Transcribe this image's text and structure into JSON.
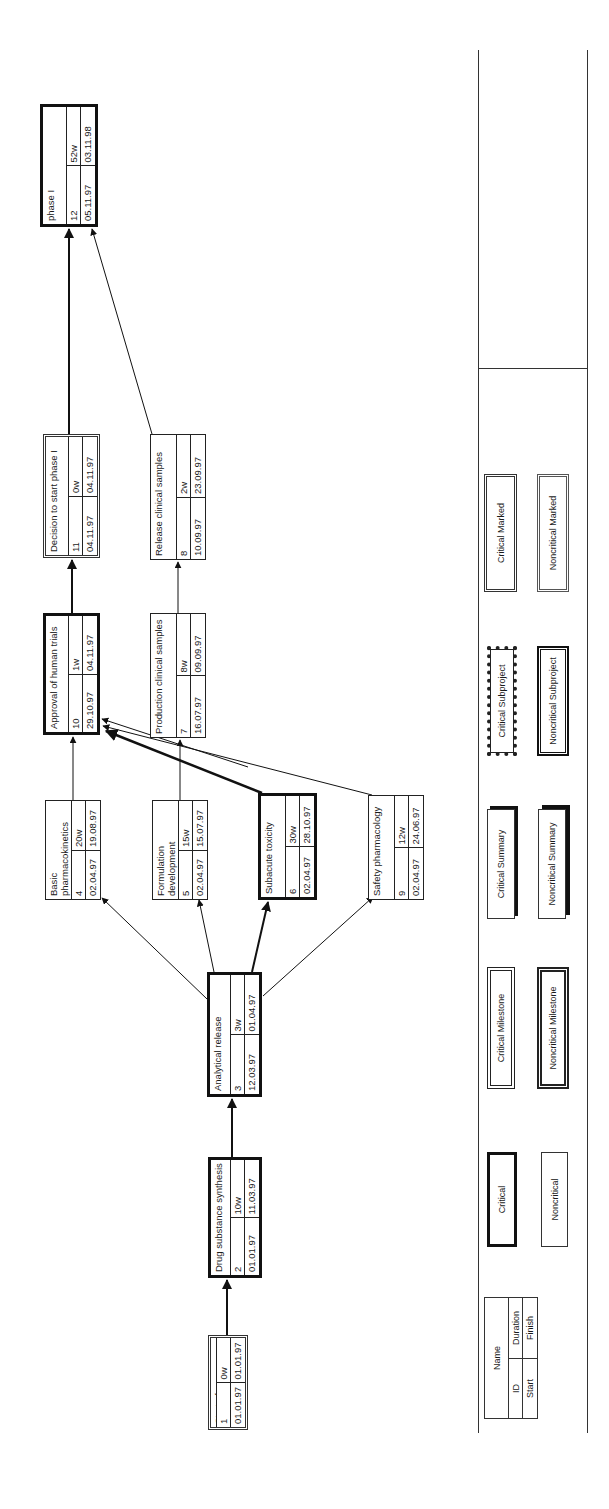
{
  "diagram": {
    "type": "network-diagram",
    "orientation": "rotated-90-ccw",
    "nodes": [
      {
        "key": "n1",
        "name": "Start of development",
        "id": "1",
        "duration": "0w",
        "start": "01.01.97",
        "finish": "01.01.97",
        "style": "milestone"
      },
      {
        "key": "n2",
        "name": "Drug substance synthesis",
        "id": "2",
        "duration": "10w",
        "start": "01.01.97",
        "finish": "11.03.97",
        "style": "critical"
      },
      {
        "key": "n3",
        "name": "Analytical release",
        "id": "3",
        "duration": "3w",
        "start": "12.03.97",
        "finish": "01.04.97",
        "style": "critical"
      },
      {
        "key": "n4",
        "name": "Basic pharmacokinetics",
        "id": "4",
        "duration": "20w",
        "start": "02.04.97",
        "finish": "19.08.97",
        "style": "noncritical"
      },
      {
        "key": "n5",
        "name": "Formulation development",
        "id": "5",
        "duration": "15w",
        "start": "02.04.97",
        "finish": "15.07.97",
        "style": "noncritical"
      },
      {
        "key": "n6",
        "name": "Subacute toxicity",
        "id": "6",
        "duration": "30w",
        "start": "02.04.97",
        "finish": "28.10.97",
        "style": "critical"
      },
      {
        "key": "n9",
        "name": "Safety pharmacology",
        "id": "9",
        "duration": "12w",
        "start": "02.04.97",
        "finish": "24.06.97",
        "style": "noncritical"
      },
      {
        "key": "n10",
        "name": "Approval of human trials",
        "id": "10",
        "duration": "1w",
        "start": "29.10.97",
        "finish": "04.11.97",
        "style": "critical"
      },
      {
        "key": "n7",
        "name": "Production clinical samples",
        "id": "7",
        "duration": "8w",
        "start": "16.07.97",
        "finish": "09.09.97",
        "style": "noncritical"
      },
      {
        "key": "n11",
        "name": "Decision to start phase I",
        "id": "11",
        "duration": "0w",
        "start": "04.11.97",
        "finish": "04.11.97",
        "style": "milestone"
      },
      {
        "key": "n8",
        "name": "Release clinical samples",
        "id": "8",
        "duration": "2w",
        "start": "10.09.97",
        "finish": "23.09.97",
        "style": "noncritical"
      },
      {
        "key": "n12",
        "name": "phase I",
        "id": "12",
        "duration": "52w",
        "start": "05.11.97",
        "finish": "03.11.98",
        "style": "critical"
      }
    ],
    "edges": [
      {
        "from": "1",
        "to": "2",
        "critical": true
      },
      {
        "from": "2",
        "to": "3",
        "critical": true
      },
      {
        "from": "3",
        "to": "4",
        "critical": false
      },
      {
        "from": "3",
        "to": "5",
        "critical": false
      },
      {
        "from": "3",
        "to": "6",
        "critical": true
      },
      {
        "from": "3",
        "to": "9",
        "critical": false
      },
      {
        "from": "4",
        "to": "10",
        "critical": false
      },
      {
        "from": "5",
        "to": "7",
        "critical": false
      },
      {
        "from": "5",
        "to": "10",
        "critical": false
      },
      {
        "from": "6",
        "to": "10",
        "critical": true
      },
      {
        "from": "9",
        "to": "10",
        "critical": false
      },
      {
        "from": "10",
        "to": "11",
        "critical": true
      },
      {
        "from": "7",
        "to": "8",
        "critical": false
      },
      {
        "from": "11",
        "to": "12",
        "critical": true
      },
      {
        "from": "8",
        "to": "12",
        "critical": false
      }
    ]
  },
  "legend": {
    "key": {
      "name": "Name",
      "id": "ID",
      "duration": "Duration",
      "start": "Start",
      "finish": "Finish"
    },
    "items": [
      {
        "label": "Critical"
      },
      {
        "label": "Noncritical"
      },
      {
        "label": "Critical Milestone"
      },
      {
        "label": "Noncritical Milestone"
      },
      {
        "label": "Critical Summary"
      },
      {
        "label": "Noncritical Summary"
      },
      {
        "label": "Critical Subproject"
      },
      {
        "label": "Noncritical Subproject"
      },
      {
        "label": "Critical Marked"
      },
      {
        "label": "Noncritical Marked"
      }
    ]
  }
}
